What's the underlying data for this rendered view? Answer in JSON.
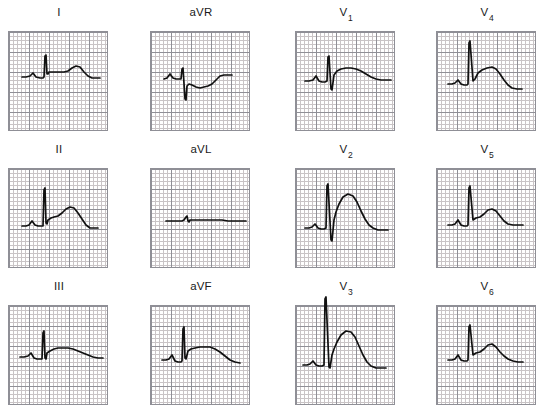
{
  "figure": {
    "name": "12-lead-ecg",
    "title": "",
    "background_color": "#ffffff",
    "trace_color": "#111111",
    "grid_fine_color": "#c9c4c6",
    "grid_bold_color": "#8f8f96",
    "layout": {
      "rows": 3,
      "cols": 4
    }
  },
  "chart_data": {
    "type": "line",
    "title": "",
    "xlabel": "",
    "ylabel": "",
    "grid": true,
    "legend": "none",
    "axis_note": "Each panel spans 100 x 100 px = 25 x 25 small squares (5 x 5 large squares); horizontal 1 large square = 0.2 s, vertical 1 large square = 0.5 mV.",
    "xlim": [
      0,
      100
    ],
    "ylim": [
      0,
      100
    ],
    "panels": [
      {
        "lead": "I",
        "label_main": "I",
        "label_sub": "",
        "row": 0,
        "col": 0,
        "baseline_y": 42,
        "qrs_amplitude_mm": 9,
        "t_amplitude_mm": 3,
        "points": "14,46 18,46 22,45 25,42 28,46 32,47 35,47 36,46 37,25 38,24 39,43 40,43 41,41 44,41 48,41 52,41 56,41 60,40 64,37 68,35 72,36 76,41 80,45 84,47 88,47 92,47"
      },
      {
        "lead": "II",
        "label_main": "II",
        "label_sub": "",
        "row": 1,
        "col": 0,
        "baseline_y": 55,
        "qrs_amplitude_mm": 14,
        "t_amplitude_mm": 5,
        "points": "14,58 18,58 21,57 24,53 27,57 30,58 33,58 35,58 36,22 37,20 38,55 39,56 40,52 43,50 46,49 50,48 54,45 58,41 62,39 66,40 70,45 74,51 78,57 82,60 86,60 90,60"
      },
      {
        "lead": "III",
        "label_main": "III",
        "label_sub": "",
        "row": 2,
        "col": 0,
        "baseline_y": 50,
        "qrs_amplitude_mm": 8,
        "t_amplitude_mm": 3,
        "points": "12,52 16,52 20,51 23,48 26,53 29,54 32,54 34,54 35,28 36,26 37,53 38,54 39,48 42,46 46,44 50,43 55,43 60,43 65,44 70,46 75,48 80,50 85,52 90,53 95,53"
      },
      {
        "lead": "aVR",
        "label_main": "aVR",
        "label_sub": "",
        "row": 0,
        "col": 1,
        "baseline_y": 46,
        "qrs_amplitude_mm": -8,
        "t_amplitude_mm": -1,
        "points": "14,48 17,47 20,43 23,47 26,48 29,48 31,48 32,38 33,37 35,68 36,69 37,55 39,53 42,54 46,56 50,57 54,56 58,55 62,53 66,49 70,45 74,44 78,44 82,44"
      },
      {
        "lead": "aVL",
        "label_main": "aVL",
        "label_sub": "",
        "row": 1,
        "col": 1,
        "baseline_y": 52,
        "qrs_amplitude_mm": 2,
        "t_amplitude_mm": 0.5,
        "points": "16,53 22,53 28,53 32,53 34,52 36,49 37,48 38,53 39,54 40,52 44,52 48,52 54,52 60,52 66,52 72,52 78,53 84,53 90,53 96,53"
      },
      {
        "lead": "aVF",
        "label_main": "aVF",
        "label_sub": "",
        "row": 2,
        "col": 1,
        "baseline_y": 52,
        "qrs_amplitude_mm": 10,
        "t_amplitude_mm": 3,
        "points": "12,55 16,55 19,54 22,50 25,56 28,57 31,57 32,56 33,24 34,22 35,53 36,54 38,46 41,44 45,43 50,42 55,42 60,42 65,44 70,47 75,51 80,55 85,57 90,58"
      },
      {
        "lead": "V1",
        "label_main": "V",
        "label_sub": "1",
        "row": 0,
        "col": 2,
        "baseline_y": 48,
        "qrs_amplitude_mm": 6,
        "t_amplitude_mm": 4,
        "points": "10,50 14,50 18,49 21,45 24,50 27,51 30,51 32,50 33,26 34,25 36,58 37,59 39,44 42,40 46,38 51,37 56,37 61,38 66,40 71,43 76,46 81,48 86,49 91,49 96,49"
      },
      {
        "lead": "V2",
        "label_main": "V",
        "label_sub": "2",
        "row": 1,
        "col": 2,
        "baseline_y": 58,
        "qrs_amplitude_mm": 16,
        "t_amplitude_mm": 9,
        "points": "10,60 14,60 17,59 20,56 23,60 26,61 29,61 31,60 32,18 33,16 36,72 37,73 39,52 41,44 44,36 48,29 53,26 58,28 62,34 66,43 70,51 74,57 78,60 83,62 88,62 93,62"
      },
      {
        "lead": "V3",
        "label_main": "V",
        "label_sub": "3",
        "row": 2,
        "col": 2,
        "baseline_y": 57,
        "qrs_amplitude_mm": 20,
        "t_amplitude_mm": 9,
        "points": "8,60 12,60 15,59 18,56 21,60 24,61 27,61 29,60 30,-6 31,-8 34,62 35,63 37,50 39,44 42,37 46,30 51,26 56,27 60,32 64,41 68,50 72,57 76,61 81,63 86,63 91,63"
      },
      {
        "lead": "V4",
        "label_main": "V",
        "label_sub": "4",
        "row": 0,
        "col": 3,
        "baseline_y": 50,
        "qrs_amplitude_mm": 17,
        "t_amplitude_mm": 5,
        "points": "12,53 16,53 19,52 22,49 25,53 28,54 31,54 32,53 33,12 34,10 37,50 39,48 42,42 46,39 51,37 56,36 60,38 64,43 68,49 72,54 76,57 81,58 86,58"
      },
      {
        "lead": "V5",
        "label_main": "V",
        "label_sub": "5",
        "row": 1,
        "col": 3,
        "baseline_y": 54,
        "qrs_amplitude_mm": 14,
        "t_amplitude_mm": 4,
        "points": "12,57 16,57 19,56 22,52 25,57 28,58 31,58 32,57 33,20 34,18 37,52 40,50 44,49 48,46 52,42 56,41 60,43 64,48 68,53 72,56 77,57 82,57 87,57"
      },
      {
        "lead": "V6",
        "label_main": "V",
        "label_sub": "6",
        "row": 2,
        "col": 3,
        "baseline_y": 52,
        "qrs_amplitude_mm": 12,
        "t_amplitude_mm": 4,
        "points": "12,55 16,55 19,54 22,50 25,55 28,56 31,56 32,55 33,22 34,20 37,50 40,48 44,47 48,44 52,40 56,39 60,42 64,47 68,51 72,54 77,56 82,57 87,57"
      }
    ]
  }
}
